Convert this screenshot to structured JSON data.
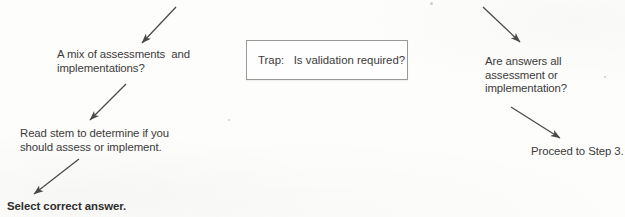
{
  "document": {
    "type": "scanned-flowchart",
    "title": "Assessment vs Implementation decision flow",
    "background_color": "#fdfdfc",
    "ink_color": "#3c3b3a",
    "arrow_color": "#4a4948",
    "box_border_color": "#9b9a98"
  },
  "left_branch": {
    "question": "A mix of assessments  and\nimplementations?",
    "action": "Read stem to determine if you\nshould assess or implement.",
    "outcome": "Select correct answer."
  },
  "center": {
    "trap_label": "Trap:",
    "trap_question": "Is validation required?",
    "trap_full": "Trap:   Is validation required?"
  },
  "right_branch": {
    "question": "Are answers all\nassessment or\nimplementation?",
    "outcome_prefix": "Proceed to ",
    "outcome_emphasis": "Step 3."
  },
  "arrows": [
    {
      "name": "arrow-into-mix-question",
      "from": [
        176,
        7
      ],
      "to": [
        141,
        44
      ],
      "direction": "down-left"
    },
    {
      "name": "arrow-mix-to-readstem",
      "from": [
        126,
        84
      ],
      "to": [
        89,
        121
      ],
      "direction": "down-left"
    },
    {
      "name": "arrow-readstem-to-select",
      "from": [
        79,
        159
      ],
      "to": [
        33,
        195
      ],
      "direction": "down-left"
    },
    {
      "name": "arrow-into-areanswers",
      "from": [
        483,
        7
      ],
      "to": [
        521,
        43
      ],
      "direction": "down-right"
    },
    {
      "name": "arrow-areanswers-to-proceed",
      "from": [
        511,
        107
      ],
      "to": [
        561,
        139
      ],
      "direction": "down-right"
    }
  ]
}
